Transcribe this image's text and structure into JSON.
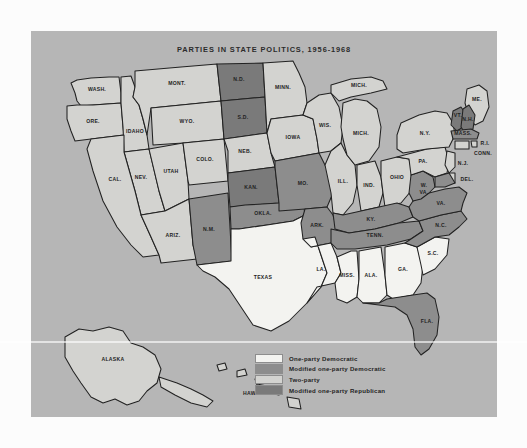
{
  "map": {
    "title": "PARTIES IN STATE POLITICS, 1956-1968",
    "panel_color": "#b6b6b6",
    "page_color": "#fcfcfc",
    "border_color": "#222222"
  },
  "categories": {
    "one_party_democratic": {
      "label": "One-party Democratic",
      "color": "#f3f3f0"
    },
    "modified_one_party_democratic": {
      "label": "Modified one-party Democratic",
      "color": "#8d8d8d"
    },
    "two_party": {
      "label": "Two-party",
      "color": "#d3d3d0"
    },
    "modified_one_party_republican": {
      "label": "Modified one-party Republican",
      "color": "#7a7a7a"
    }
  },
  "legend": {
    "items": [
      {
        "label": "One-party Democratic",
        "color": "#f3f3f0"
      },
      {
        "label": "Modified one-party Democratic",
        "color": "#8d8d8d"
      },
      {
        "label": "Two-party",
        "color": "#d3d3d0"
      },
      {
        "label": "Modified one-party Republican",
        "color": "#7a7a7a"
      }
    ]
  },
  "map_data": {
    "type": "choropleth",
    "region": "United States",
    "period": "1956-1968",
    "classification_scheme": [
      "One-party Democratic",
      "Modified one-party Democratic",
      "Two-party",
      "Modified one-party Republican"
    ],
    "states": [
      {
        "code": "WASH.",
        "label": "WASH.",
        "category": "two_party"
      },
      {
        "code": "ORE.",
        "label": "ORE.",
        "category": "two_party"
      },
      {
        "code": "IDAHO",
        "label": "IDAHO",
        "category": "two_party"
      },
      {
        "code": "MONT.",
        "label": "MONT.",
        "category": "two_party"
      },
      {
        "code": "WYO.",
        "label": "WYO.",
        "category": "two_party"
      },
      {
        "code": "NEV.",
        "label": "NEV.",
        "category": "two_party"
      },
      {
        "code": "UTAH",
        "label": "UTAH",
        "category": "two_party"
      },
      {
        "code": "CAL.",
        "label": "CAL.",
        "category": "two_party"
      },
      {
        "code": "ARIZ.",
        "label": "ARIZ.",
        "category": "two_party"
      },
      {
        "code": "COLO.",
        "label": "COLO.",
        "category": "two_party"
      },
      {
        "code": "N.M.",
        "label": "N.M.",
        "category": "modified_one_party_democratic"
      },
      {
        "code": "N.D.",
        "label": "N.D.",
        "category": "modified_one_party_republican"
      },
      {
        "code": "S.D.",
        "label": "S.D.",
        "category": "modified_one_party_republican"
      },
      {
        "code": "NEB.",
        "label": "NEB.",
        "category": "two_party"
      },
      {
        "code": "KAN.",
        "label": "KAN.",
        "category": "modified_one_party_republican"
      },
      {
        "code": "OKLA.",
        "label": "OKLA.",
        "category": "modified_one_party_democratic"
      },
      {
        "code": "TEXAS",
        "label": "TEXAS",
        "category": "one_party_democratic"
      },
      {
        "code": "MINN.",
        "label": "MINN.",
        "category": "two_party"
      },
      {
        "code": "IOWA",
        "label": "IOWA",
        "category": "two_party"
      },
      {
        "code": "MO.",
        "label": "MO.",
        "category": "modified_one_party_democratic"
      },
      {
        "code": "ARK.",
        "label": "ARK.",
        "category": "modified_one_party_democratic"
      },
      {
        "code": "LA.",
        "label": "LA.",
        "category": "one_party_democratic"
      },
      {
        "code": "WIS.",
        "label": "WIS.",
        "category": "two_party"
      },
      {
        "code": "ILL.",
        "label": "ILL.",
        "category": "two_party"
      },
      {
        "code": "MICH.",
        "label": "MICH.",
        "category": "two_party"
      },
      {
        "code": "MICH.U",
        "label": "MICH.",
        "category": "two_party"
      },
      {
        "code": "IND.",
        "label": "IND.",
        "category": "two_party"
      },
      {
        "code": "OHIO",
        "label": "OHIO",
        "category": "two_party"
      },
      {
        "code": "KY.",
        "label": "KY.",
        "category": "modified_one_party_democratic"
      },
      {
        "code": "TENN.",
        "label": "TENN.",
        "category": "modified_one_party_democratic"
      },
      {
        "code": "MISS.",
        "label": "MISS.",
        "category": "one_party_democratic"
      },
      {
        "code": "ALA.",
        "label": "ALA.",
        "category": "one_party_democratic"
      },
      {
        "code": "GA.",
        "label": "GA.",
        "category": "one_party_democratic"
      },
      {
        "code": "FLA.",
        "label": "FLA.",
        "category": "modified_one_party_democratic"
      },
      {
        "code": "S.C.",
        "label": "S.C.",
        "category": "one_party_democratic"
      },
      {
        "code": "N.C.",
        "label": "N.C.",
        "category": "modified_one_party_democratic"
      },
      {
        "code": "VA.",
        "label": "VA.",
        "category": "modified_one_party_democratic"
      },
      {
        "code": "W. VA.",
        "label": "W.",
        "label2": "VA.",
        "category": "modified_one_party_democratic"
      },
      {
        "code": "PA.",
        "label": "PA.",
        "category": "two_party"
      },
      {
        "code": "N.Y.",
        "label": "N.Y.",
        "category": "two_party"
      },
      {
        "code": "ME.",
        "label": "ME.",
        "category": "two_party"
      },
      {
        "code": "VT.",
        "label": "VT.",
        "category": "modified_one_party_republican"
      },
      {
        "code": "N.H.",
        "label": "N.H.",
        "category": "modified_one_party_republican"
      },
      {
        "code": "MASS.",
        "label": "MASS.",
        "category": "modified_one_party_democratic"
      },
      {
        "code": "R.I.",
        "label": "R.I.",
        "category": "two_party"
      },
      {
        "code": "CONN.",
        "label": "CONN.",
        "category": "two_party"
      },
      {
        "code": "N.J.",
        "label": "N.J.",
        "category": "two_party"
      },
      {
        "code": "DEL.",
        "label": "DEL.",
        "category": "two_party"
      },
      {
        "code": "MD.",
        "label": "",
        "category": "modified_one_party_democratic"
      },
      {
        "code": "ALASKA",
        "label": "ALASKA",
        "category": "two_party"
      },
      {
        "code": "HAWAII",
        "label": "HAWAII",
        "category": "two_party"
      }
    ]
  }
}
